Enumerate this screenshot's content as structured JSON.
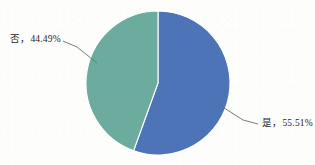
{
  "chart_data": {
    "type": "pie",
    "title": "",
    "subtitle": "",
    "xlabel": "",
    "ylabel": "",
    "legend_position": "none",
    "grid": false,
    "labels_position": "outside-with-leader-lines",
    "start_angle_deg": 0,
    "direction": "clockwise",
    "categories": [
      "是",
      "否"
    ],
    "values": [
      55.51,
      44.49
    ],
    "units": "%",
    "colors": [
      "#4e74b8",
      "#6cac9e"
    ],
    "slices": [
      {
        "name": "是",
        "value": 55.51,
        "percent_text": "55.51%",
        "label_text": "是，55.51%",
        "color": "#4e74b8"
      },
      {
        "name": "否",
        "value": 44.49,
        "percent_text": "44.49%",
        "label_text": "否，44.49%",
        "color": "#6cac9e"
      }
    ]
  },
  "labels": {
    "no_slice": "否，44.49%",
    "yes_slice": "是，55.51%"
  },
  "style": {
    "background": "#fdfdfc",
    "text_color": "#262626",
    "leader_line_color": "#6d6d6d",
    "slice_border_color": "#ffffff"
  }
}
